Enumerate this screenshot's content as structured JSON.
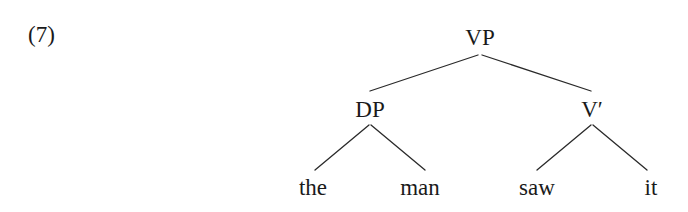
{
  "example_number": "(7)",
  "tree": {
    "root": {
      "label": "VP",
      "children": [
        {
          "label": "DP",
          "children": [
            {
              "label": "the"
            },
            {
              "label": "man"
            }
          ]
        },
        {
          "label": "V′",
          "children": [
            {
              "label": "saw"
            },
            {
              "label": "it"
            }
          ]
        }
      ]
    }
  }
}
